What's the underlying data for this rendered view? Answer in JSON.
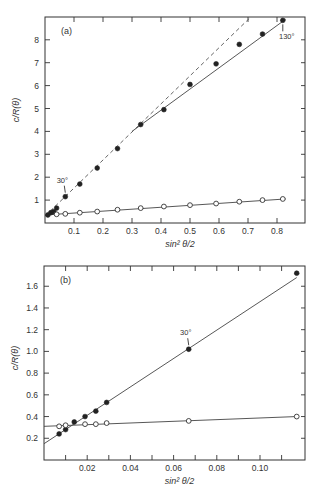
{
  "chart_data": [
    {
      "type": "scatter",
      "panel_label": "(a)",
      "title": "",
      "xlabel": "sin² θ/2",
      "ylabel": "c/R(θ)",
      "xlim": [
        0,
        0.9
      ],
      "ylim": [
        0,
        9
      ],
      "x_ticks": [
        0.1,
        0.2,
        0.3,
        0.4,
        0.5,
        0.6,
        0.7,
        0.8
      ],
      "x_tick_labels": [
        "0.1",
        "0.2",
        "0.3",
        "0.4",
        "0.5",
        "0.6",
        "0.7",
        "0.8"
      ],
      "y_ticks": [
        1,
        2,
        3,
        4,
        5,
        6,
        7,
        8
      ],
      "y_tick_labels": [
        "1",
        "2",
        "3",
        "4",
        "5",
        "6",
        "7",
        "8"
      ],
      "grid": false,
      "series": [
        {
          "name": "filled circles",
          "marker": "filled",
          "x": [
            0.01,
            0.02,
            0.03,
            0.04,
            0.07,
            0.12,
            0.18,
            0.25,
            0.33,
            0.41,
            0.5,
            0.59,
            0.67,
            0.75,
            0.82
          ],
          "y": [
            0.35,
            0.45,
            0.5,
            0.65,
            1.15,
            1.7,
            2.4,
            3.25,
            4.3,
            4.95,
            6.05,
            6.95,
            7.8,
            8.25,
            8.85
          ]
        },
        {
          "name": "open circles",
          "marker": "open",
          "x": [
            0.04,
            0.07,
            0.12,
            0.18,
            0.25,
            0.33,
            0.41,
            0.5,
            0.59,
            0.67,
            0.75,
            0.82
          ],
          "y": [
            0.38,
            0.4,
            0.45,
            0.5,
            0.58,
            0.65,
            0.72,
            0.78,
            0.85,
            0.93,
            1.0,
            1.05
          ]
        }
      ],
      "lines": [
        {
          "style": "dashed",
          "from": [
            0.0,
            0.3
          ],
          "to": [
            0.71,
            9.0
          ]
        },
        {
          "style": "solid",
          "from": [
            0.3,
            4.0
          ],
          "to": [
            0.83,
            8.9
          ]
        },
        {
          "style": "solid",
          "from": [
            0.0,
            0.35
          ],
          "to": [
            0.83,
            1.05
          ]
        }
      ],
      "annotations": [
        {
          "text": "30°",
          "x": 0.07,
          "y": 1.15,
          "label_pos": "above"
        },
        {
          "text": "130°",
          "x": 0.82,
          "y": 8.85,
          "label_pos": "below"
        }
      ]
    },
    {
      "type": "scatter",
      "panel_label": "(b)",
      "title": "",
      "xlabel": "sin² θ/2",
      "ylabel": "c/R(θ)",
      "xlim": [
        0,
        0.12
      ],
      "ylim": [
        0,
        1.8
      ],
      "x_ticks": [
        0.02,
        0.04,
        0.06,
        0.08,
        0.1
      ],
      "x_tick_labels": [
        "0.02",
        "0.04",
        "0.06",
        "0.08",
        "0.10"
      ],
      "x_minor_ticks": [
        0.01,
        0.03,
        0.05,
        0.07,
        0.09,
        0.11
      ],
      "y_ticks": [
        0.2,
        0.4,
        0.6,
        0.8,
        1.0,
        1.2,
        1.4,
        1.6
      ],
      "y_tick_labels": [
        "0.2",
        "0.4",
        "0.6",
        "0.8",
        "1.0",
        "1.2",
        "1.4",
        "1.6"
      ],
      "grid": false,
      "series": [
        {
          "name": "filled circles",
          "marker": "filled",
          "x": [
            0.007,
            0.01,
            0.014,
            0.019,
            0.024,
            0.029,
            0.067,
            0.117
          ],
          "y": [
            0.24,
            0.28,
            0.35,
            0.4,
            0.45,
            0.53,
            1.02,
            1.72
          ]
        },
        {
          "name": "open circles",
          "marker": "open",
          "x": [
            0.007,
            0.01,
            0.019,
            0.024,
            0.029,
            0.067,
            0.117
          ],
          "y": [
            0.31,
            0.32,
            0.33,
            0.33,
            0.34,
            0.36,
            0.4
          ]
        }
      ],
      "lines": [
        {
          "style": "solid",
          "from": [
            0.0,
            0.15
          ],
          "to": [
            0.117,
            1.68
          ]
        },
        {
          "style": "solid",
          "from": [
            0.0,
            0.31
          ],
          "to": [
            0.117,
            0.4
          ]
        }
      ],
      "annotations": [
        {
          "text": "30°",
          "x": 0.067,
          "y": 1.02,
          "label_pos": "above"
        }
      ]
    }
  ]
}
